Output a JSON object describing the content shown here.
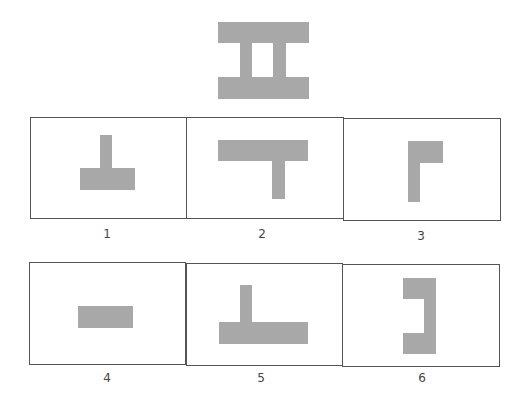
{
  "question": {
    "target_shape": {
      "name": "double-bar-h-shape",
      "color": "#a8a8a8",
      "parts": [
        {
          "x": 218,
          "y": 22,
          "w": 91,
          "h": 21
        },
        {
          "x": 240,
          "y": 43,
          "w": 12,
          "h": 34
        },
        {
          "x": 273,
          "y": 43,
          "w": 13,
          "h": 34
        },
        {
          "x": 218,
          "y": 77,
          "w": 91,
          "h": 22
        }
      ]
    }
  },
  "options": [
    {
      "label": "1",
      "box": {
        "x": 30,
        "y": 117,
        "w": 157,
        "h": 102
      },
      "parts": [
        {
          "x": 100,
          "y": 135,
          "w": 12,
          "h": 33
        },
        {
          "x": 80,
          "y": 168,
          "w": 55,
          "h": 22
        }
      ],
      "label_pos": {
        "x": 97,
        "y": 227
      }
    },
    {
      "label": "2",
      "box": {
        "x": 186,
        "y": 117,
        "w": 158,
        "h": 102
      },
      "parts": [
        {
          "x": 218,
          "y": 140,
          "w": 90,
          "h": 21
        },
        {
          "x": 272,
          "y": 161,
          "w": 13,
          "h": 38
        }
      ],
      "label_pos": {
        "x": 252,
        "y": 227
      }
    },
    {
      "label": "3",
      "box": {
        "x": 343,
        "y": 118,
        "w": 158,
        "h": 103
      },
      "parts": [
        {
          "x": 408,
          "y": 141,
          "w": 12,
          "h": 61
        },
        {
          "x": 420,
          "y": 141,
          "w": 23,
          "h": 22
        }
      ],
      "label_pos": {
        "x": 411,
        "y": 229
      }
    },
    {
      "label": "4",
      "box": {
        "x": 29,
        "y": 262,
        "w": 157,
        "h": 103
      },
      "parts": [
        {
          "x": 78,
          "y": 306,
          "w": 55,
          "h": 22
        }
      ],
      "label_pos": {
        "x": 97,
        "y": 371
      }
    },
    {
      "label": "5",
      "box": {
        "x": 186,
        "y": 263,
        "w": 157,
        "h": 103
      },
      "parts": [
        {
          "x": 240,
          "y": 285,
          "w": 12,
          "h": 37
        },
        {
          "x": 219,
          "y": 322,
          "w": 89,
          "h": 22
        }
      ],
      "label_pos": {
        "x": 251,
        "y": 371
      }
    },
    {
      "label": "6",
      "box": {
        "x": 342,
        "y": 264,
        "w": 158,
        "h": 103
      },
      "parts": [
        {
          "x": 403,
          "y": 278,
          "w": 33,
          "h": 21
        },
        {
          "x": 424,
          "y": 299,
          "w": 12,
          "h": 34
        },
        {
          "x": 403,
          "y": 333,
          "w": 33,
          "h": 21
        }
      ],
      "label_pos": {
        "x": 412,
        "y": 371
      }
    }
  ]
}
